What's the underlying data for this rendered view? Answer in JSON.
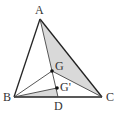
{
  "diagram": {
    "type": "triangle-centroid-figure",
    "colors": {
      "line": "#222222",
      "thin_line": "#444444",
      "shade": "#d9d9d9",
      "point": "#111111",
      "label": "#333333"
    },
    "points": {
      "A": {
        "label": "A",
        "x": 40,
        "y": 19,
        "lx": 35,
        "ly": 14
      },
      "B": {
        "label": "B",
        "x": 14,
        "y": 97,
        "lx": 3,
        "ly": 101
      },
      "C": {
        "label": "C",
        "x": 102,
        "y": 97,
        "lx": 106,
        "ly": 101
      },
      "D": {
        "label": "D",
        "x": 58,
        "y": 97,
        "lx": 54,
        "ly": 110
      },
      "G": {
        "label": "G",
        "x": 52,
        "y": 71,
        "lx": 55,
        "ly": 70
      },
      "Gp": {
        "label": "G'",
        "x": 57,
        "y": 88,
        "lx": 60,
        "ly": 91
      }
    },
    "shaded_regions": [
      {
        "name": "triangle-AGC",
        "vertices": [
          "A",
          "G",
          "C"
        ]
      },
      {
        "name": "triangle-BGpD",
        "vertices": [
          "B",
          "Gp",
          "D"
        ]
      }
    ],
    "segments": [
      {
        "from": "A",
        "to": "B",
        "weight": "thick"
      },
      {
        "from": "A",
        "to": "C",
        "weight": "thick"
      },
      {
        "from": "B",
        "to": "C",
        "weight": "thick"
      },
      {
        "from": "A",
        "to": "D",
        "weight": "thin"
      },
      {
        "from": "B",
        "to": "G",
        "weight": "thin"
      },
      {
        "from": "G",
        "to": "C",
        "weight": "thin"
      },
      {
        "from": "B",
        "to": "Gp",
        "weight": "thin"
      }
    ]
  }
}
